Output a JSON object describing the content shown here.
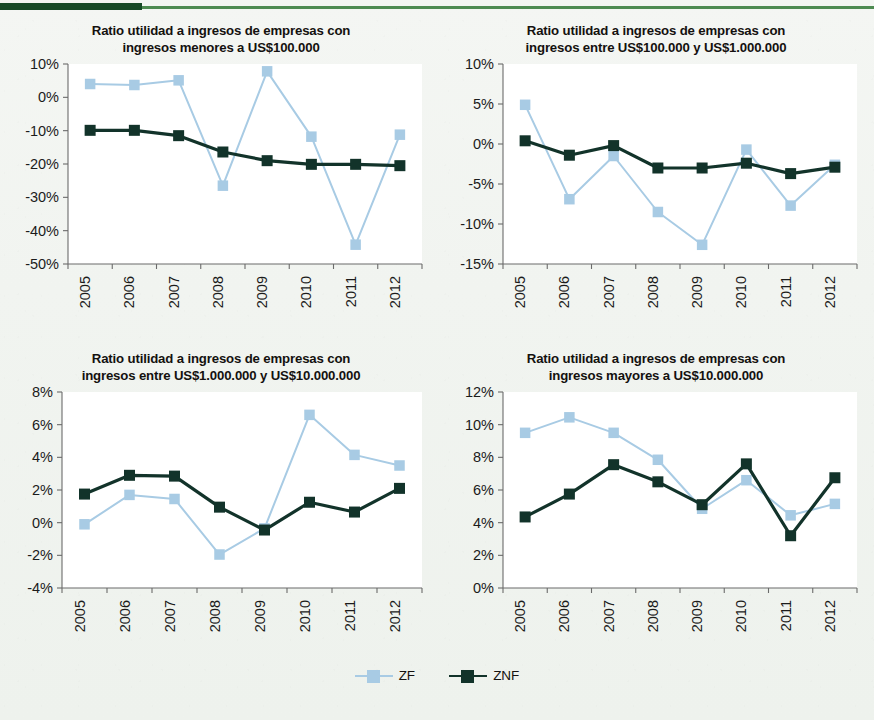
{
  "figure": {
    "accent_rule_color": "#4e8b52",
    "accent_block_color": "#184a27",
    "background_color": "#f2f5f1",
    "series_colors": {
      "ZF": "#a8cbe4",
      "ZNF": "#12332a"
    }
  },
  "legend": {
    "position": "bottom-center",
    "items": [
      {
        "label": "ZF",
        "color": "#a8cbe4",
        "marker": "square"
      },
      {
        "label": "ZNF",
        "color": "#12332a",
        "marker": "square"
      }
    ]
  },
  "chart_data": [
    {
      "id": "panel-top-left",
      "type": "line",
      "title": "Ratio utilidad a ingresos de empresas con ingresos menores a US$100.000",
      "title_line1": "Ratio utilidad a ingresos de empresas con",
      "title_line2": "ingresos menores a US$100.000",
      "xlabel": "",
      "ylabel": "",
      "grid": false,
      "categories": [
        "2005",
        "2006",
        "2007",
        "2008",
        "2009",
        "2010",
        "2011",
        "2012"
      ],
      "ylim": [
        -50,
        10
      ],
      "yticks": [
        10,
        0,
        -10,
        -20,
        -30,
        -40,
        -50
      ],
      "ytick_labels": [
        "10%",
        "0%",
        "-10%",
        "-20%",
        "-30%",
        "-40%",
        "-50%"
      ],
      "series": [
        {
          "name": "ZF",
          "values": [
            4.0,
            3.7,
            5.1,
            -26.5,
            7.8,
            -11.8,
            -44.2,
            -11.2
          ]
        },
        {
          "name": "ZNF",
          "values": [
            -9.9,
            -9.9,
            -11.5,
            -16.4,
            -19.0,
            -20.1,
            -20.1,
            -20.5
          ]
        }
      ]
    },
    {
      "id": "panel-top-right",
      "type": "line",
      "title": "Ratio utilidad a ingresos de empresas con ingresos entre US$100.000 y US$1.000.000",
      "title_line1": "Ratio utilidad a ingresos de empresas con",
      "title_line2": "ingresos entre US$100.000 y US$1.000.000",
      "xlabel": "",
      "ylabel": "",
      "grid": false,
      "categories": [
        "2005",
        "2006",
        "2007",
        "2008",
        "2009",
        "2010",
        "2011",
        "2012"
      ],
      "ylim": [
        -15,
        10
      ],
      "yticks": [
        10,
        5,
        0,
        -5,
        -10,
        -15
      ],
      "ytick_labels": [
        "10%",
        "5%",
        "0%",
        "-5%",
        "-10%",
        "-15%"
      ],
      "series": [
        {
          "name": "ZF",
          "values": [
            4.9,
            -6.9,
            -1.5,
            -8.5,
            -12.6,
            -0.7,
            -7.7,
            -2.6
          ]
        },
        {
          "name": "ZNF",
          "values": [
            0.4,
            -1.4,
            -0.2,
            -3.0,
            -3.0,
            -2.4,
            -3.7,
            -2.9
          ]
        }
      ]
    },
    {
      "id": "panel-bottom-left",
      "type": "line",
      "title": "Ratio utilidad a ingresos de empresas con ingresos entre US$1.000.000 y US$10.000.000",
      "title_line1": "Ratio utilidad a ingresos de empresas con",
      "title_line2": "ingresos entre US$1.000.000 y US$10.000.000",
      "xlabel": "",
      "ylabel": "",
      "grid": false,
      "categories": [
        "2005",
        "2006",
        "2007",
        "2008",
        "2009",
        "2010",
        "2011",
        "2012"
      ],
      "ylim": [
        -4,
        8
      ],
      "yticks": [
        8,
        6,
        4,
        2,
        0,
        -2,
        -4
      ],
      "ytick_labels": [
        "8%",
        "6%",
        "4%",
        "2%",
        "0%",
        "-2%",
        "-4%"
      ],
      "series": [
        {
          "name": "ZF",
          "values": [
            -0.1,
            1.7,
            1.45,
            -1.95,
            -0.35,
            6.6,
            4.15,
            3.5
          ]
        },
        {
          "name": "ZNF",
          "values": [
            1.75,
            2.9,
            2.85,
            0.95,
            -0.45,
            1.25,
            0.65,
            2.1
          ]
        }
      ]
    },
    {
      "id": "panel-bottom-right",
      "type": "line",
      "title": "Ratio utilidad a ingresos de empresas con ingresos mayores a US$10.000.000",
      "title_line1": "Ratio utilidad a ingresos de empresas con",
      "title_line2": "ingresos mayores a US$10.000.000",
      "xlabel": "",
      "ylabel": "",
      "grid": false,
      "categories": [
        "2005",
        "2006",
        "2007",
        "2008",
        "2009",
        "2010",
        "2011",
        "2012"
      ],
      "ylim": [
        0,
        12
      ],
      "yticks": [
        12,
        10,
        8,
        6,
        4,
        2,
        0
      ],
      "ytick_labels": [
        "12%",
        "10%",
        "8%",
        "6%",
        "4%",
        "2%",
        "0%"
      ],
      "series": [
        {
          "name": "ZF",
          "values": [
            9.5,
            10.45,
            9.5,
            7.85,
            4.85,
            6.6,
            4.45,
            5.15
          ]
        },
        {
          "name": "ZNF",
          "values": [
            4.35,
            5.75,
            7.55,
            6.5,
            5.1,
            7.6,
            3.2,
            6.75
          ]
        }
      ]
    }
  ]
}
